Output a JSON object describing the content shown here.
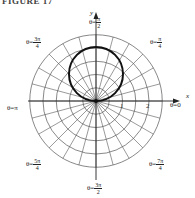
{
  "figure": {
    "title": "FIGURE 17"
  },
  "axes": {
    "x_label": "x",
    "y_label": "y",
    "tick_labels": [
      "1",
      "2"
    ]
  },
  "angle_labels": {
    "theta_0": {
      "prefix": "θ=",
      "whole": "0"
    },
    "theta_pi4": {
      "prefix": "θ=",
      "num": "π",
      "den": "4"
    },
    "theta_pi2": {
      "prefix": "θ=",
      "num": "π",
      "den": "2"
    },
    "theta_3pi4": {
      "prefix": "θ=",
      "num": "3π",
      "den": "4"
    },
    "theta_pi": {
      "prefix": "θ=",
      "whole": "π"
    },
    "theta_5pi4": {
      "prefix": "θ=",
      "num": "5π",
      "den": "4"
    },
    "theta_3pi2": {
      "prefix": "θ=",
      "num": "3π",
      "den": "2"
    },
    "theta_7pi4": {
      "prefix": "θ=",
      "num": "7π",
      "den": "4"
    }
  },
  "colors": {
    "grid": "#555555",
    "curve": "#111111",
    "background": "#ffffff"
  },
  "chart_data": {
    "type": "polar",
    "title": "FIGURE 17",
    "curve": "r = 2 sin θ (circle of diameter 2 above the pole)",
    "grid": {
      "radial_rings": [
        0.5,
        1.0,
        1.5,
        2.0,
        2.5
      ],
      "angular_step_deg": 15
    },
    "axis_ticks": [
      1,
      2
    ],
    "angle_labels": [
      "θ=0",
      "θ=π/4",
      "θ=π/2",
      "θ=3π/4",
      "θ=π",
      "θ=5π/4",
      "θ=3π/2",
      "θ=7π/4"
    ],
    "xlabel": "x",
    "ylabel": "y"
  }
}
